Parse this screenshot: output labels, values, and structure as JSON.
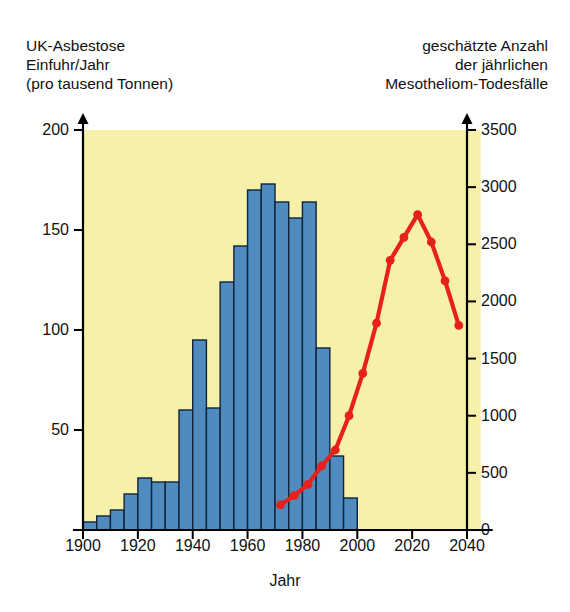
{
  "header": {
    "left_title_lines": [
      "UK-Asbestose",
      "Einfuhr/Jahr",
      "(pro tausend Tonnen)"
    ],
    "right_title_lines": [
      "geschätzte Anzahl",
      "der jährlichen",
      "Mesotheliom-Todesfälle"
    ]
  },
  "colors": {
    "plot_background": "#f7f0a8",
    "bar_fill": "#4f8bbf",
    "bar_stroke": "#12233a",
    "line": "#e8201c",
    "axis": "#000000",
    "text": "#111111"
  },
  "chart_data": {
    "type": "bar",
    "xlabel": "Jahr",
    "ylabel": "UK-Asbestose Einfuhr/Jahr (pro tausend Tonnen)",
    "y2label": "geschätzte Anzahl der jährlichen Mesotheliom-Todesfälle",
    "xlim": [
      1900,
      2045
    ],
    "ylim": [
      0,
      200
    ],
    "y2lim": [
      0,
      3500
    ],
    "grid": false,
    "legend": "none",
    "xticks": [
      1900,
      1920,
      1940,
      1960,
      1980,
      2000,
      2020,
      2040
    ],
    "xticklabels": [
      "1900",
      "1920",
      "1940",
      "1960",
      "1980",
      "2000",
      "2020",
      "2040"
    ],
    "yticks": [
      0,
      50,
      100,
      150,
      200
    ],
    "yticklabels": [
      "",
      "50",
      "100",
      "150",
      "200"
    ],
    "y2ticks": [
      0,
      500,
      1000,
      1500,
      2000,
      2500,
      3000,
      3500
    ],
    "y2ticklabels": [
      "0",
      "500",
      "1000",
      "1500",
      "2000",
      "2500",
      "3000",
      "3500"
    ],
    "series": [
      {
        "name": "UK-Asbest-Einfuhr",
        "type": "bar",
        "axis": "left",
        "bin_width_years": 5,
        "categories": [
          1900,
          1905,
          1910,
          1915,
          1920,
          1925,
          1930,
          1935,
          1940,
          1945,
          1950,
          1955,
          1960,
          1965,
          1970,
          1975,
          1980,
          1985,
          1990
        ],
        "values": [
          4,
          7,
          10,
          18,
          26,
          24,
          24,
          60,
          95,
          61,
          124,
          142,
          170,
          173,
          164,
          156,
          164,
          91,
          37,
          16
        ]
      },
      {
        "name": "Mesotheliom-Todesfälle",
        "type": "line",
        "axis": "right",
        "marker": "circle",
        "x": [
          1972,
          1977,
          1982,
          1987,
          1992,
          1997,
          2002,
          2007,
          2012,
          2017,
          2022,
          2027,
          2032,
          2037
        ],
        "values": [
          220,
          300,
          400,
          560,
          700,
          1000,
          1370,
          1810,
          2360,
          2560,
          2760,
          2520,
          2180,
          1790
        ]
      }
    ]
  },
  "axis_titles": {
    "x": "Jahr"
  }
}
